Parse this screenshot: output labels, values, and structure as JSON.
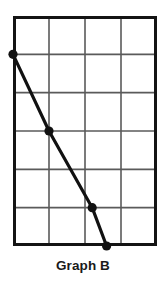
{
  "caption": "Graph B",
  "colors": {
    "background": "#ffffff",
    "border": "#141414",
    "gridline": "#5a5a5a",
    "series_line": "#111111",
    "marker": "#111111",
    "caption_text": "#1a1a1a"
  },
  "chart_data": {
    "type": "line",
    "title": "Graph B",
    "xlabel": "",
    "ylabel": "",
    "xlim": [
      0,
      4
    ],
    "ylim": [
      0,
      6
    ],
    "grid": true,
    "grid_columns": 4,
    "grid_rows": 6,
    "legend": "none",
    "axis_tick_labels": {
      "x": [],
      "y": []
    },
    "series": [
      {
        "name": "Graph B",
        "x": [
          0,
          1,
          2.2,
          2.6
        ],
        "y": [
          5,
          3,
          1,
          0
        ],
        "markers": true,
        "marker_shape": "circle"
      }
    ]
  }
}
